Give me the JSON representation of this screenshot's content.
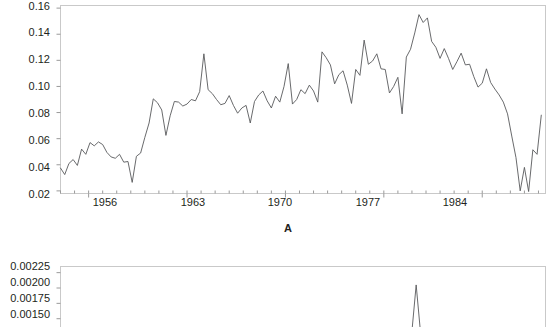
{
  "figure": {
    "background": "#ffffff",
    "line_color": "#58595b",
    "axis_color": "#c9c9c9",
    "text_color": "#231f20"
  },
  "panel_a": {
    "title": "A",
    "y_ticks": [
      "0.02",
      "0.04",
      "0.06",
      "0.08",
      "0.10",
      "0.12",
      "0.14",
      "0.16"
    ],
    "x_ticks": [
      "1956",
      "1963",
      "1970",
      "1977",
      "1984"
    ]
  },
  "panel_b": {
    "y_ticks": [
      "0.00150",
      "0.00175",
      "0.00200",
      "0.00225"
    ]
  },
  "chart_data": [
    {
      "type": "line",
      "title": "A",
      "xlabel": "",
      "ylabel": "",
      "xlim": [
        1954.0,
        1988.5
      ],
      "ylim": [
        0.018,
        0.162
      ],
      "xticks": [
        1956,
        1963,
        1970,
        1977,
        1984
      ],
      "yticks": [
        0.02,
        0.04,
        0.06,
        0.08,
        0.1,
        0.12,
        0.14,
        0.16
      ],
      "grid": false,
      "legend": null,
      "series": [
        {
          "name": "A",
          "x": [
            1954.0,
            1954.3,
            1954.6,
            1954.9,
            1955.2,
            1955.5,
            1955.8,
            1956.1,
            1956.4,
            1956.7,
            1957.0,
            1957.3,
            1957.6,
            1957.9,
            1958.2,
            1958.5,
            1958.8,
            1959.1,
            1959.4,
            1959.7,
            1960.0,
            1960.3,
            1960.6,
            1960.9,
            1961.2,
            1961.5,
            1961.8,
            1962.1,
            1962.4,
            1962.7,
            1963.0,
            1963.3,
            1963.6,
            1963.9,
            1964.2,
            1964.5,
            1964.8,
            1965.1,
            1965.4,
            1965.7,
            1966.0,
            1966.3,
            1966.6,
            1966.9,
            1967.2,
            1967.5,
            1967.8,
            1968.1,
            1968.4,
            1968.7,
            1969.0,
            1969.3,
            1969.6,
            1969.9,
            1970.2,
            1970.5,
            1970.8,
            1971.1,
            1971.4,
            1971.7,
            1972.0,
            1972.3,
            1972.6,
            1972.9,
            1973.2,
            1973.5,
            1973.8,
            1974.1,
            1974.4,
            1974.7,
            1975.0,
            1975.3,
            1975.6,
            1975.9,
            1976.2,
            1976.5,
            1976.8,
            1977.1,
            1977.4,
            1977.7,
            1978.0,
            1978.3,
            1978.6,
            1978.9,
            1979.2,
            1979.5,
            1979.8,
            1980.1,
            1980.4,
            1980.7,
            1981.0,
            1981.3,
            1981.6,
            1981.9,
            1982.2,
            1982.5,
            1982.8,
            1983.1,
            1983.4,
            1983.7,
            1984.0,
            1984.3,
            1984.6,
            1984.9,
            1985.2,
            1985.5,
            1985.8,
            1986.1,
            1986.4,
            1986.7,
            1987.0,
            1987.3,
            1987.6,
            1987.9,
            1988.2
          ],
          "y": [
            0.0375,
            0.0325,
            0.041,
            0.044,
            0.0395,
            0.052,
            0.048,
            0.057,
            0.0545,
            0.0575,
            0.0555,
            0.0495,
            0.046,
            0.045,
            0.048,
            0.042,
            0.0425,
            0.0265,
            0.0465,
            0.049,
            0.061,
            0.072,
            0.0905,
            0.0875,
            0.082,
            0.0625,
            0.0775,
            0.0885,
            0.088,
            0.085,
            0.0865,
            0.09,
            0.089,
            0.096,
            0.125,
            0.0975,
            0.0945,
            0.09,
            0.086,
            0.087,
            0.093,
            0.0855,
            0.0795,
            0.0835,
            0.0855,
            0.072,
            0.0885,
            0.0935,
            0.0965,
            0.089,
            0.0835,
            0.0925,
            0.088,
            0.1,
            0.1175,
            0.0865,
            0.09,
            0.0975,
            0.0945,
            0.101,
            0.0965,
            0.088,
            0.1265,
            0.122,
            0.1165,
            0.102,
            0.109,
            0.112,
            0.101,
            0.087,
            0.113,
            0.1085,
            0.1355,
            0.117,
            0.1195,
            0.125,
            0.1135,
            0.113,
            0.095,
            0.1,
            0.107,
            0.079,
            0.1225,
            0.1285,
            0.141,
            0.155,
            0.149,
            0.1525,
            0.1345,
            0.13,
            0.1215,
            0.129,
            0.1215,
            0.113,
            0.119,
            0.1255,
            0.1165,
            0.117,
            0.1075,
            0.0995,
            0.1025,
            0.1135,
            0.103,
            0.098,
            0.0935,
            0.088,
            0.079,
            0.062,
            0.0455,
            0.02,
            0.038,
            0.0195,
            0.0515,
            0.048,
            0.078
          ]
        }
      ]
    },
    {
      "type": "line",
      "title": "",
      "xlabel": "",
      "ylabel": "",
      "xlim": [
        1954.0,
        1988.5
      ],
      "ylim": [
        0.0013,
        0.00235
      ],
      "yticks": [
        0.0015,
        0.00175,
        0.002,
        0.00225
      ],
      "grid": false,
      "legend": null,
      "series": [
        {
          "name": "B",
          "x": [
            1954.0,
            1970.0,
            1979.0,
            1979.3,
            1979.6,
            1980.0,
            1988.2
          ],
          "y": [
            0.0013,
            0.0013,
            0.0013,
            0.00205,
            0.0013,
            0.0013,
            0.0013
          ]
        }
      ]
    }
  ]
}
